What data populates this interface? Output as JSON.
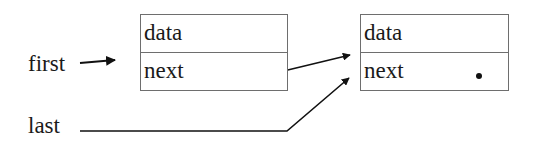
{
  "diagram": {
    "type": "linked-list",
    "pointers": [
      {
        "id": "first",
        "label": "first",
        "target": "node1"
      },
      {
        "id": "last",
        "label": "last",
        "target": "node2"
      }
    ],
    "nodes": [
      {
        "id": "node1",
        "fields": [
          {
            "name": "data",
            "label": "data"
          },
          {
            "name": "next",
            "label": "next",
            "points_to": "node2"
          }
        ]
      },
      {
        "id": "node2",
        "fields": [
          {
            "name": "data",
            "label": "data"
          },
          {
            "name": "next",
            "label": "next",
            "value": "null-dot"
          }
        ]
      }
    ],
    "colors": {
      "ink": "#1a1a1a",
      "box_border": "#6e6e6e",
      "background": "#ffffff"
    }
  }
}
